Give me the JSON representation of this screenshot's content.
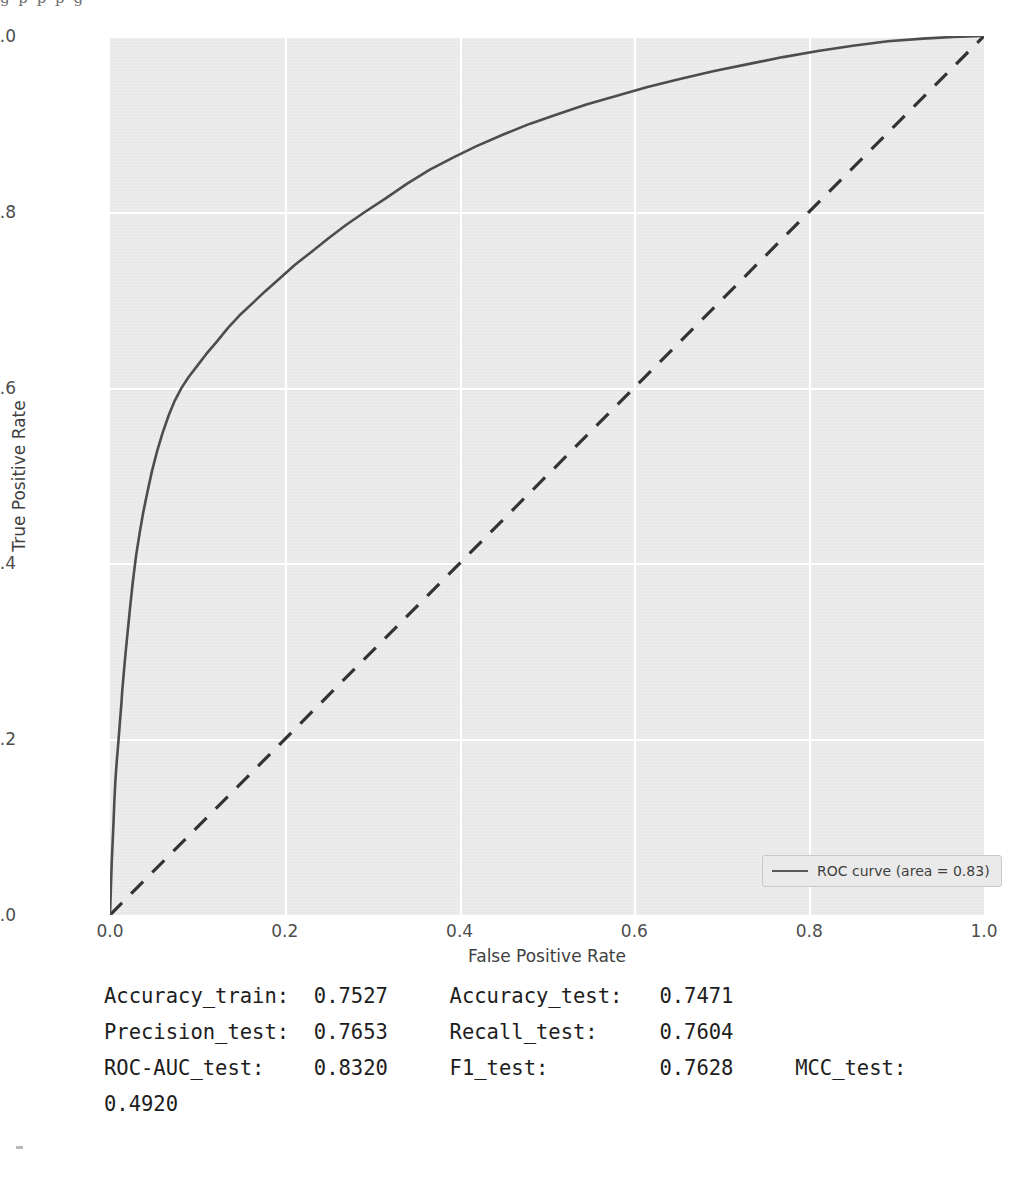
{
  "top_artifact": {
    "text": "g        p              p            p        g"
  },
  "chart_data": {
    "type": "line",
    "title": "",
    "xlabel": "False Positive Rate",
    "ylabel": "True Positive Rate",
    "xlim": [
      0.0,
      1.0
    ],
    "ylim": [
      0.0,
      1.0
    ],
    "xticks": [
      "0.0",
      "0.2",
      "0.4",
      "0.6",
      "0.8",
      "1.0"
    ],
    "yticks": [
      "0.0",
      "0.2",
      "0.4",
      "0.6",
      "0.8",
      "1.0"
    ],
    "xtick_values": [
      0.0,
      0.2,
      0.4,
      0.6,
      0.8,
      1.0
    ],
    "ytick_values": [
      0.0,
      0.2,
      0.4,
      0.6,
      0.8,
      1.0
    ],
    "grid": true,
    "grid_color": "#ffffff",
    "plot_bg": "#eaeaea",
    "legend_position": "lower right",
    "series": [
      {
        "name": "ROC curve (area = 0.83)",
        "style": "solid",
        "color": "#4d4d4d",
        "x": [
          0.0,
          0.002,
          0.004,
          0.005,
          0.006,
          0.007,
          0.008,
          0.009,
          0.01,
          0.011,
          0.012,
          0.013,
          0.014,
          0.016,
          0.018,
          0.02,
          0.023,
          0.026,
          0.03,
          0.034,
          0.038,
          0.043,
          0.048,
          0.054,
          0.06,
          0.067,
          0.074,
          0.082,
          0.09,
          0.1,
          0.11,
          0.122,
          0.135,
          0.148,
          0.162,
          0.178,
          0.195,
          0.212,
          0.23,
          0.25,
          0.27,
          0.292,
          0.315,
          0.34,
          0.366,
          0.393,
          0.42,
          0.45,
          0.48,
          0.512,
          0.545,
          0.58,
          0.615,
          0.652,
          0.69,
          0.73,
          0.77,
          0.81,
          0.85,
          0.89,
          0.93,
          0.965,
          1.0
        ],
        "y": [
          0.0,
          0.06,
          0.105,
          0.13,
          0.15,
          0.165,
          0.178,
          0.19,
          0.202,
          0.215,
          0.228,
          0.24,
          0.255,
          0.278,
          0.3,
          0.32,
          0.35,
          0.378,
          0.41,
          0.435,
          0.458,
          0.482,
          0.505,
          0.528,
          0.548,
          0.568,
          0.585,
          0.6,
          0.612,
          0.625,
          0.638,
          0.652,
          0.668,
          0.682,
          0.695,
          0.71,
          0.725,
          0.74,
          0.754,
          0.77,
          0.785,
          0.8,
          0.815,
          0.832,
          0.848,
          0.862,
          0.875,
          0.888,
          0.9,
          0.911,
          0.922,
          0.932,
          0.942,
          0.951,
          0.96,
          0.968,
          0.976,
          0.983,
          0.989,
          0.994,
          0.997,
          0.999,
          1.0
        ]
      },
      {
        "name": "chance-diagonal",
        "style": "dashed",
        "color": "#333333",
        "x": [
          0.0,
          1.0
        ],
        "y": [
          0.0,
          1.0
        ]
      }
    ]
  },
  "legend": {
    "label": "ROC curve (area = 0.83)"
  },
  "metrics": {
    "text": "Accuracy_train:  0.7527     Accuracy_test:   0.7471\nPrecision_test:  0.7653     Recall_test:     0.7604\nROC-AUC_test:    0.8320     F1_test:         0.7628     MCC_test:   0.4920",
    "items": [
      {
        "label": "Accuracy_train:",
        "value": "0.7527"
      },
      {
        "label": "Accuracy_test:",
        "value": "0.7471"
      },
      {
        "label": "Precision_test:",
        "value": "0.7653"
      },
      {
        "label": "Recall_test:",
        "value": "0.7604"
      },
      {
        "label": "ROC-AUC_test:",
        "value": "0.8320"
      },
      {
        "label": "F1_test:",
        "value": "0.7628"
      },
      {
        "label": "MCC_test:",
        "value": "0.4920"
      }
    ]
  }
}
